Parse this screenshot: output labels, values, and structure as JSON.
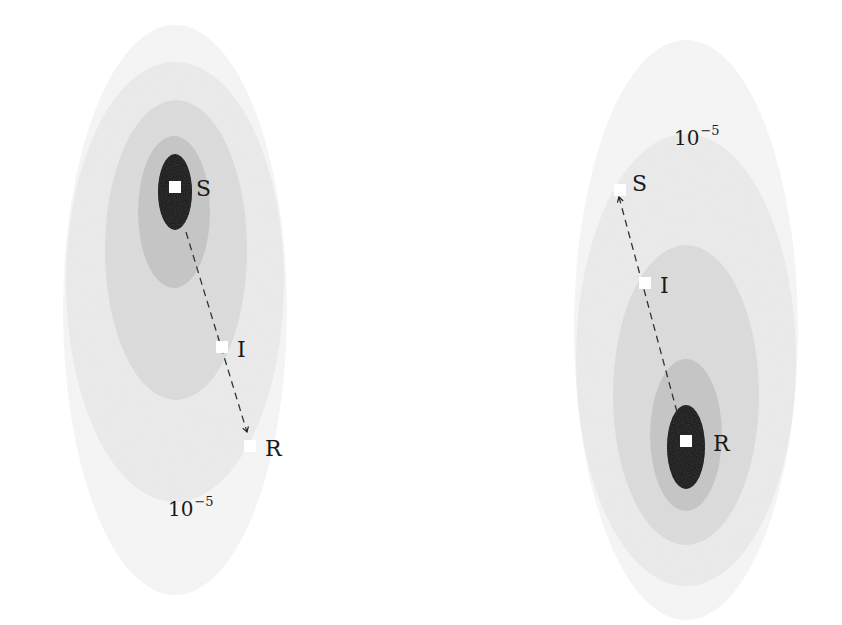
{
  "figure": {
    "panels": [
      {
        "id": "left",
        "contours": [
          {
            "level": "faint",
            "cx": 175,
            "cy": 310,
            "rx": 112,
            "ry": 285,
            "color": "#f6f6f6"
          },
          {
            "level": "light",
            "cx": 175,
            "cy": 282,
            "rx": 109,
            "ry": 220,
            "color": "#ebebeb"
          },
          {
            "level": "mid",
            "cx": 176,
            "cy": 250,
            "rx": 71,
            "ry": 150,
            "color": "#dcdcdc"
          },
          {
            "level": "dark",
            "cx": 174,
            "cy": 212,
            "rx": 36,
            "ry": 76,
            "color": "#c6c6c6"
          },
          {
            "level": "peak",
            "cx": 175,
            "cy": 192,
            "rx": 17,
            "ry": 38,
            "color": "#050505"
          }
        ],
        "nodes": [
          {
            "label": "S",
            "x": 175,
            "y": 187,
            "label_x": 196,
            "label_y": 196
          },
          {
            "label": "I",
            "x": 222,
            "y": 347,
            "label_x": 237,
            "label_y": 357
          },
          {
            "label": "R",
            "x": 250,
            "y": 446,
            "label_x": 265,
            "label_y": 456
          }
        ],
        "arrow": {
          "x1": 186,
          "y1": 232,
          "x2": 247,
          "y2": 432
        },
        "contour_label": {
          "base": "10",
          "exponent": "−5",
          "x": 168,
          "y": 516
        }
      },
      {
        "id": "right",
        "contours": [
          {
            "level": "faint",
            "cx": 686,
            "cy": 330,
            "rx": 112,
            "ry": 290,
            "color": "#f6f6f6"
          },
          {
            "level": "light",
            "cx": 686,
            "cy": 360,
            "rx": 110,
            "ry": 226,
            "color": "#ebebeb"
          },
          {
            "level": "mid",
            "cx": 686,
            "cy": 395,
            "rx": 73,
            "ry": 150,
            "color": "#dcdcdc"
          },
          {
            "level": "dark",
            "cx": 686,
            "cy": 435,
            "rx": 36,
            "ry": 76,
            "color": "#c6c6c6"
          },
          {
            "level": "peak",
            "cx": 686,
            "cy": 447,
            "rx": 19,
            "ry": 42,
            "color": "#050505"
          }
        ],
        "nodes": [
          {
            "label": "S",
            "x": 620,
            "y": 190,
            "label_x": 632,
            "label_y": 191
          },
          {
            "label": "I",
            "x": 645,
            "y": 283,
            "label_x": 660,
            "label_y": 293
          },
          {
            "label": "R",
            "x": 686,
            "y": 441,
            "label_x": 713,
            "label_y": 451
          }
        ],
        "arrow": {
          "x1": 677,
          "y1": 412,
          "x2": 619,
          "y2": 197
        },
        "contour_label": {
          "base": "10",
          "exponent": "−5",
          "x": 674,
          "y": 145
        }
      }
    ]
  }
}
